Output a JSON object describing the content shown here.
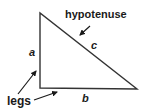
{
  "diagram": {
    "labels": {
      "hypotenuse": "hypotenuse",
      "legs": "legs",
      "a": "a",
      "b": "b",
      "c": "c"
    },
    "vertices": {
      "top": [
        40,
        13
      ],
      "right_angle": [
        40,
        88
      ],
      "bottom_right": [
        137,
        89
      ]
    },
    "colors": {
      "stroke": "#333333",
      "text": "#1a1a1a",
      "background": "#ffffff"
    }
  }
}
